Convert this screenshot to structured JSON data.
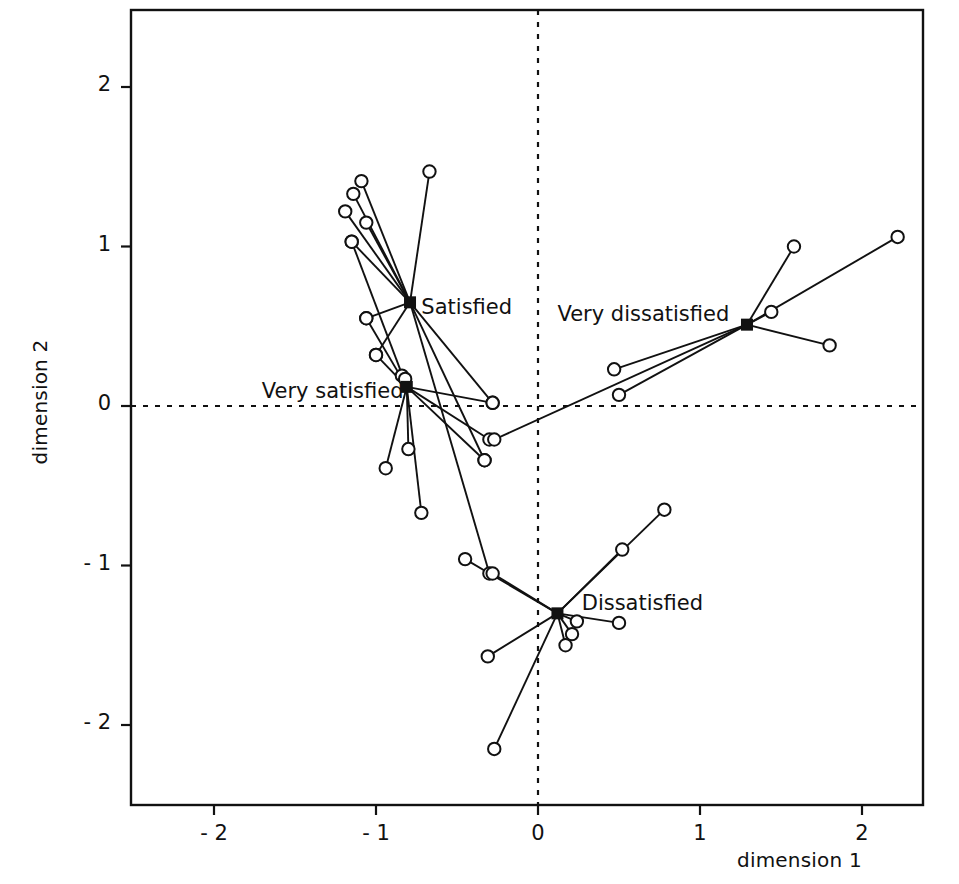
{
  "chart_data": {
    "type": "scatter",
    "title": "",
    "subtitle": "",
    "xlabel": "dimension 1",
    "ylabel": "dimension 2",
    "xlim": [
      -2.512,
      2.377
    ],
    "ylim": [
      -2.502,
      2.483
    ],
    "xticks": [
      -2,
      -1,
      0,
      1,
      2
    ],
    "xticklabels": [
      "- 2",
      "- 1",
      "0",
      "1",
      "2"
    ],
    "yticks": [
      -2,
      -1,
      0,
      1,
      2
    ],
    "yticklabels": [
      "- 2",
      "- 1",
      "0",
      "1",
      "2"
    ],
    "grid": false,
    "legend": "none",
    "reference_lines": [
      {
        "name": "vertical-zero-line",
        "axis": "x",
        "value": 0,
        "style": "dashed"
      },
      {
        "name": "horizontal-zero-line",
        "axis": "y",
        "value": 0,
        "style": "dashed"
      }
    ],
    "marker_styles": {
      "centroid": "filled-black-square",
      "satellite": "open-circle"
    },
    "groups": [
      {
        "name": "Very satisfied",
        "label": "Very satisfied",
        "label_anchor": "end",
        "label_x": -0.83,
        "label_y": 0.1,
        "centroid": [
          -0.81,
          0.12
        ],
        "points": [
          [
            -1.15,
            1.03
          ],
          [
            -1.06,
            0.55
          ],
          [
            -1.0,
            0.32
          ],
          [
            -0.84,
            0.19
          ],
          [
            -0.82,
            0.17
          ],
          [
            -0.8,
            -0.27
          ],
          [
            -0.94,
            -0.39
          ],
          [
            -0.72,
            -0.67
          ],
          [
            -0.28,
            0.02
          ],
          [
            -0.3,
            -0.21
          ],
          [
            -0.33,
            -0.34
          ]
        ]
      },
      {
        "name": "Satisfied",
        "label": "Satisfied",
        "label_anchor": "start",
        "label_x": -0.72,
        "label_y": 0.63,
        "centroid": [
          -0.79,
          0.65
        ],
        "points": [
          [
            -1.09,
            1.41
          ],
          [
            -1.14,
            1.33
          ],
          [
            -1.19,
            1.22
          ],
          [
            -1.06,
            1.15
          ],
          [
            -1.15,
            1.03
          ],
          [
            -0.67,
            1.47
          ],
          [
            -1.06,
            0.55
          ],
          [
            -1.0,
            0.32
          ],
          [
            -0.28,
            0.02
          ],
          [
            -0.33,
            -0.34
          ],
          [
            -0.3,
            -1.05
          ]
        ]
      },
      {
        "name": "Very dissatisfied",
        "label": "Very dissatisfied",
        "label_anchor": "start",
        "label_x": 0.12,
        "label_y": 0.58,
        "centroid": [
          1.29,
          0.51
        ],
        "points": [
          [
            1.58,
            1.0
          ],
          [
            2.22,
            1.06
          ],
          [
            1.44,
            0.59
          ],
          [
            1.8,
            0.38
          ],
          [
            0.47,
            0.23
          ],
          [
            0.5,
            0.07
          ],
          [
            -0.27,
            -0.21
          ]
        ]
      },
      {
        "name": "Dissatisfied",
        "label": "Dissatisfied",
        "label_anchor": "start",
        "label_x": 0.27,
        "label_y": -1.23,
        "centroid": [
          0.12,
          -1.3
        ],
        "points": [
          [
            0.78,
            -0.65
          ],
          [
            0.52,
            -0.9
          ],
          [
            -0.45,
            -0.96
          ],
          [
            -0.28,
            -1.05
          ],
          [
            0.24,
            -1.35
          ],
          [
            0.5,
            -1.36
          ],
          [
            0.21,
            -1.43
          ],
          [
            0.17,
            -1.5
          ],
          [
            -0.31,
            -1.57
          ],
          [
            -0.27,
            -2.15
          ]
        ]
      }
    ]
  },
  "axes": {
    "frame": {
      "left": 131,
      "right": 923,
      "top": 10,
      "bottom": 805
    },
    "x_origin_px": 538,
    "y_origin_px": 406,
    "px_per_unit_x": 162,
    "px_per_unit_y": 159.5
  },
  "colors": {
    "ink": "#111111",
    "background": "#ffffff",
    "marker_fill": "#ffffff"
  }
}
